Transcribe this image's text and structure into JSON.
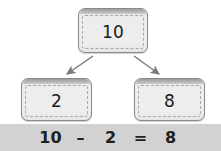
{
  "diagram": {
    "type": "number-bond-subtraction",
    "whole": {
      "label": "10"
    },
    "parts": [
      {
        "label": "2"
      },
      {
        "label": "8"
      }
    ],
    "arrows": [
      {
        "name": "arrow-whole-to-part-1",
        "direction": "down-left"
      },
      {
        "name": "arrow-whole-to-part-2",
        "direction": "down-right"
      }
    ]
  },
  "equation": {
    "minuend": "10",
    "minus_sign": "–",
    "subtrahend": "2",
    "equals_sign": "=",
    "difference": "8"
  },
  "colors": {
    "card_fill": "#ebebeb",
    "card_border": "#8a8a8a",
    "card_lid": "#b4b4b4",
    "dashed_border": "#a9a9a9",
    "arrow": "#7a7a7a",
    "equation_bar_bg": "#d2d2d2",
    "text": "#1b1b1b",
    "page_bg": "#ffffff"
  }
}
